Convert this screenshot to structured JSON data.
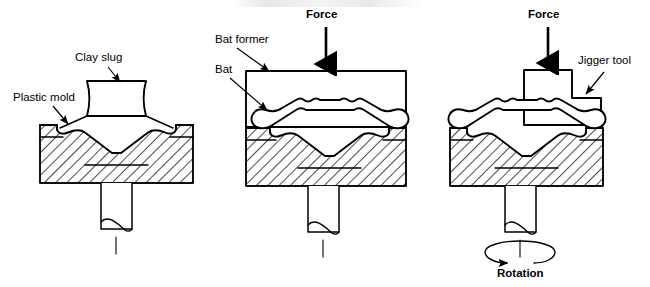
{
  "figure": {
    "background_color": "#ffffff",
    "line_color": "#000000"
  },
  "panels": [
    {
      "id": "panel-1",
      "step": "1",
      "labels": [
        {
          "name": "clay-slug-label",
          "text": "Clay slug"
        },
        {
          "name": "plastic-mold-label",
          "text": "Plastic mold"
        }
      ]
    },
    {
      "id": "panel-2",
      "step": "2",
      "labels": [
        {
          "name": "force-label",
          "text": "Force"
        },
        {
          "name": "bat-former-label",
          "text": "Bat former"
        },
        {
          "name": "bat-label",
          "text": "Bat"
        }
      ]
    },
    {
      "id": "panel-3",
      "step": "3",
      "labels": [
        {
          "name": "force-label",
          "text": "Force"
        },
        {
          "name": "jigger-tool-label",
          "text": "Jigger tool"
        },
        {
          "name": "rotation-label",
          "text": "Rotation"
        }
      ]
    }
  ],
  "text": {
    "clay_slug": "Clay slug",
    "plastic_mold": "Plastic mold",
    "force_mid": "Force",
    "bat_former": "Bat former",
    "bat": "Bat",
    "force_right": "Force",
    "jigger_tool": "Jigger tool",
    "rotation": "Rotation"
  }
}
